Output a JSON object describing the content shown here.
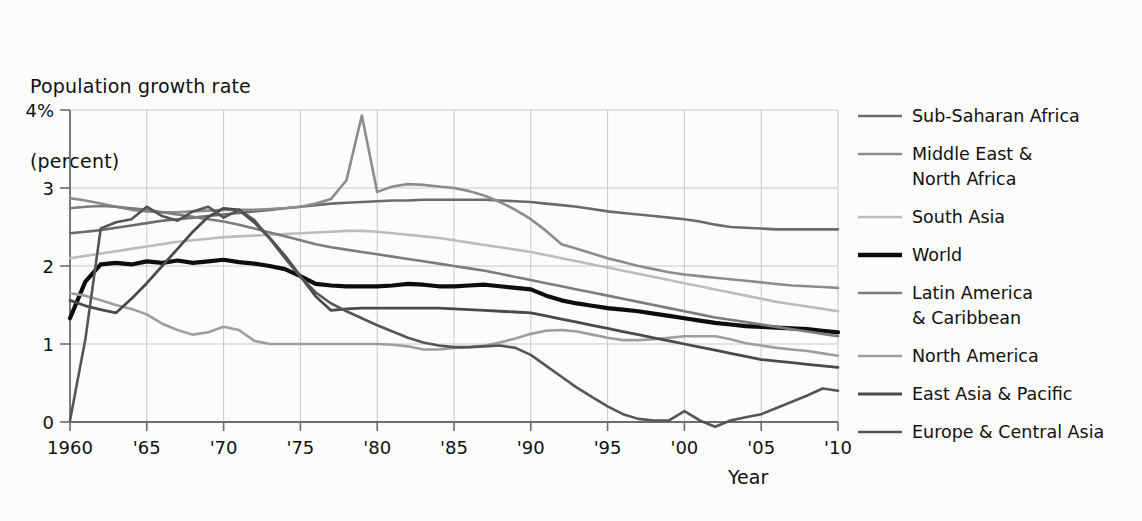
{
  "chart_data": {
    "type": "line",
    "title": "Population growth rate (percent)",
    "ylabel_line1": "Population growth rate",
    "ylabel_line2": "(percent)",
    "xlabel": "Year",
    "grid": "both",
    "legend_position": "right",
    "xlim": [
      1960,
      2010
    ],
    "ylim": [
      0,
      4
    ],
    "x_tick_labels": [
      "1960",
      "'65",
      "'70",
      "'75",
      "'80",
      "'85",
      "'90",
      "'95",
      "'00",
      "'05",
      "'10"
    ],
    "x_tick_values": [
      1960,
      1965,
      1970,
      1975,
      1980,
      1985,
      1990,
      1995,
      2000,
      2005,
      2010
    ],
    "y_tick_labels": [
      "0",
      "1",
      "2",
      "3",
      "4%"
    ],
    "y_tick_values": [
      0,
      1,
      2,
      3,
      4
    ],
    "x": [
      1960,
      1961,
      1962,
      1963,
      1964,
      1965,
      1966,
      1967,
      1968,
      1969,
      1970,
      1971,
      1972,
      1973,
      1974,
      1975,
      1976,
      1977,
      1978,
      1979,
      1980,
      1981,
      1982,
      1983,
      1984,
      1985,
      1986,
      1987,
      1988,
      1989,
      1990,
      1991,
      1992,
      1993,
      1994,
      1995,
      1996,
      1997,
      1998,
      1999,
      2000,
      2001,
      2002,
      2003,
      2004,
      2005,
      2006,
      2007,
      2008,
      2009,
      2010
    ],
    "series": [
      {
        "name": "Sub-Saharan Africa",
        "color": "#6b6b6b",
        "width": 2.6,
        "values": [
          2.42,
          2.44,
          2.46,
          2.49,
          2.52,
          2.55,
          2.58,
          2.6,
          2.62,
          2.64,
          2.66,
          2.68,
          2.7,
          2.72,
          2.74,
          2.76,
          2.78,
          2.8,
          2.81,
          2.82,
          2.83,
          2.84,
          2.84,
          2.85,
          2.85,
          2.85,
          2.85,
          2.85,
          2.84,
          2.83,
          2.82,
          2.8,
          2.78,
          2.76,
          2.73,
          2.7,
          2.68,
          2.66,
          2.64,
          2.62,
          2.6,
          2.57,
          2.53,
          2.5,
          2.49,
          2.48,
          2.47,
          2.47,
          2.47,
          2.47,
          2.47
        ]
      },
      {
        "name": "Middle East & North Africa",
        "color": "#8c8c8c",
        "width": 2.6,
        "values": [
          2.87,
          2.84,
          2.8,
          2.76,
          2.72,
          2.7,
          2.69,
          2.69,
          2.7,
          2.71,
          2.72,
          2.72,
          2.72,
          2.73,
          2.74,
          2.76,
          2.8,
          2.86,
          3.1,
          3.93,
          2.95,
          3.02,
          3.05,
          3.04,
          3.02,
          3.0,
          2.96,
          2.9,
          2.82,
          2.72,
          2.6,
          2.45,
          2.28,
          2.22,
          2.16,
          2.1,
          2.05,
          2.0,
          1.96,
          1.92,
          1.89,
          1.87,
          1.85,
          1.83,
          1.81,
          1.79,
          1.77,
          1.75,
          1.74,
          1.73,
          1.72
        ]
      },
      {
        "name": "South Asia",
        "color": "#bcbcbc",
        "width": 2.6,
        "values": [
          2.1,
          2.13,
          2.16,
          2.19,
          2.22,
          2.25,
          2.28,
          2.31,
          2.33,
          2.35,
          2.37,
          2.38,
          2.39,
          2.4,
          2.41,
          2.42,
          2.43,
          2.44,
          2.45,
          2.45,
          2.44,
          2.42,
          2.4,
          2.38,
          2.36,
          2.33,
          2.3,
          2.27,
          2.24,
          2.21,
          2.18,
          2.14,
          2.1,
          2.06,
          2.02,
          1.98,
          1.94,
          1.9,
          1.86,
          1.82,
          1.78,
          1.74,
          1.7,
          1.66,
          1.62,
          1.58,
          1.54,
          1.51,
          1.48,
          1.45,
          1.42
        ]
      },
      {
        "name": "World",
        "color": "#0d0d0d",
        "width": 4.2,
        "values": [
          1.33,
          1.8,
          2.02,
          2.04,
          2.02,
          2.06,
          2.04,
          2.07,
          2.04,
          2.06,
          2.08,
          2.05,
          2.03,
          2.0,
          1.96,
          1.87,
          1.77,
          1.75,
          1.74,
          1.74,
          1.74,
          1.75,
          1.77,
          1.76,
          1.74,
          1.74,
          1.75,
          1.76,
          1.74,
          1.72,
          1.7,
          1.62,
          1.56,
          1.52,
          1.49,
          1.46,
          1.44,
          1.42,
          1.39,
          1.36,
          1.33,
          1.3,
          1.27,
          1.25,
          1.23,
          1.22,
          1.21,
          1.2,
          1.19,
          1.17,
          1.15
        ]
      },
      {
        "name": "Latin America & Caribbean",
        "color": "#7c7c7c",
        "width": 2.6,
        "values": [
          2.74,
          2.76,
          2.77,
          2.76,
          2.74,
          2.72,
          2.69,
          2.66,
          2.63,
          2.6,
          2.57,
          2.53,
          2.48,
          2.43,
          2.38,
          2.33,
          2.28,
          2.24,
          2.21,
          2.18,
          2.15,
          2.12,
          2.09,
          2.06,
          2.03,
          2.0,
          1.97,
          1.94,
          1.9,
          1.86,
          1.82,
          1.78,
          1.74,
          1.7,
          1.66,
          1.62,
          1.58,
          1.54,
          1.5,
          1.46,
          1.42,
          1.38,
          1.34,
          1.31,
          1.28,
          1.25,
          1.22,
          1.19,
          1.16,
          1.13,
          1.1
        ]
      },
      {
        "name": "North America",
        "color": "#9e9e9e",
        "width": 2.6,
        "values": [
          1.65,
          1.62,
          1.56,
          1.5,
          1.45,
          1.38,
          1.26,
          1.18,
          1.12,
          1.15,
          1.22,
          1.18,
          1.04,
          1.0,
          1.0,
          1.0,
          1.0,
          1.0,
          1.0,
          1.0,
          1.0,
          0.99,
          0.97,
          0.93,
          0.93,
          0.95,
          0.96,
          0.98,
          1.02,
          1.07,
          1.13,
          1.17,
          1.18,
          1.16,
          1.12,
          1.08,
          1.05,
          1.05,
          1.06,
          1.08,
          1.1,
          1.1,
          1.1,
          1.06,
          1.01,
          0.98,
          0.95,
          0.93,
          0.91,
          0.88,
          0.85
        ]
      },
      {
        "name": "East Asia & Pacific",
        "color": "#4a4a4a",
        "width": 2.8,
        "values": [
          1.56,
          1.49,
          1.44,
          1.4,
          1.58,
          1.78,
          2.0,
          2.22,
          2.44,
          2.63,
          2.74,
          2.72,
          2.56,
          2.36,
          2.13,
          1.87,
          1.61,
          1.43,
          1.45,
          1.46,
          1.46,
          1.46,
          1.46,
          1.46,
          1.46,
          1.45,
          1.44,
          1.43,
          1.42,
          1.41,
          1.4,
          1.36,
          1.32,
          1.28,
          1.24,
          1.2,
          1.16,
          1.12,
          1.08,
          1.04,
          1.0,
          0.96,
          0.92,
          0.88,
          0.84,
          0.8,
          0.78,
          0.76,
          0.74,
          0.72,
          0.7
        ]
      },
      {
        "name": "Europe & Central Asia",
        "color": "#555555",
        "width": 2.6,
        "values": [
          0.02,
          1.06,
          2.48,
          2.56,
          2.6,
          2.76,
          2.64,
          2.58,
          2.7,
          2.76,
          2.62,
          2.72,
          2.59,
          2.35,
          2.1,
          1.86,
          1.66,
          1.52,
          1.42,
          1.33,
          1.24,
          1.16,
          1.08,
          1.02,
          0.98,
          0.96,
          0.96,
          0.97,
          0.98,
          0.95,
          0.86,
          0.72,
          0.58,
          0.44,
          0.32,
          0.2,
          0.1,
          0.04,
          0.02,
          0.02,
          0.14,
          0.02,
          -0.06,
          0.02,
          0.06,
          0.1,
          0.18,
          0.26,
          0.34,
          0.43,
          0.4
        ]
      }
    ],
    "legend_entries": [
      {
        "label": "Sub-Saharan Africa",
        "color": "#6b6b6b",
        "width": 2.6,
        "lines": [
          "Sub-Saharan Africa"
        ]
      },
      {
        "label": "Middle East & North Africa",
        "color": "#8c8c8c",
        "width": 2.6,
        "lines": [
          "Middle East &",
          "North Africa"
        ]
      },
      {
        "label": "South Asia",
        "color": "#bcbcbc",
        "width": 2.6,
        "lines": [
          "South Asia"
        ]
      },
      {
        "label": "World",
        "color": "#0d0d0d",
        "width": 4.6,
        "lines": [
          "World"
        ]
      },
      {
        "label": "Latin America & Caribbean",
        "color": "#7c7c7c",
        "width": 2.6,
        "lines": [
          "Latin America",
          "& Caribbean"
        ]
      },
      {
        "label": "North America",
        "color": "#9e9e9e",
        "width": 2.6,
        "lines": [
          "North America"
        ]
      },
      {
        "label": "East Asia & Pacific",
        "color": "#4a4a4a",
        "width": 2.8,
        "lines": [
          "East Asia & Pacific"
        ]
      },
      {
        "label": "Europe & Central Asia",
        "color": "#555555",
        "width": 2.6,
        "lines": [
          "Europe & Central Asia"
        ]
      }
    ]
  },
  "colors": {
    "background": "#fcfcfb",
    "grid": "#c9c9c9",
    "axis": "#6d6d6d",
    "text": "#101010"
  }
}
